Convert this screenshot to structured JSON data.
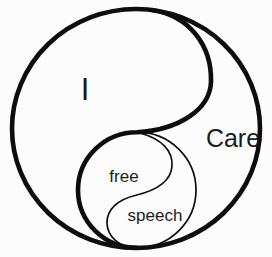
{
  "diagram": {
    "type": "nested-yin-yang",
    "labels": {
      "outer_left": "I",
      "outer_right": "Care",
      "inner_top": "free",
      "inner_bottom": "speech"
    },
    "colors": {
      "stroke": "#0d0d0d",
      "text": "#1c1c1c",
      "background": "#fcfcfc"
    }
  }
}
